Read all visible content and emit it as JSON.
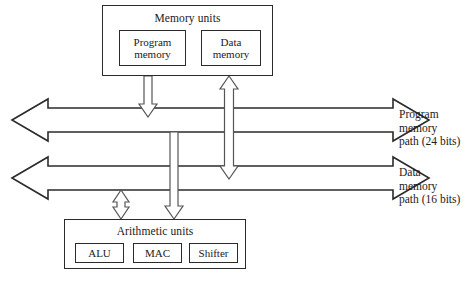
{
  "diagram": {
    "memory_units": {
      "title": "Memory units",
      "units": [
        {
          "id": "program-memory",
          "label": "Program\nmemory"
        },
        {
          "id": "data-memory",
          "label": "Data\nmemory"
        }
      ]
    },
    "arithmetic_units": {
      "title": "Arithmetic units",
      "units": [
        {
          "id": "alu",
          "label": "ALU"
        },
        {
          "id": "mac",
          "label": "MAC"
        },
        {
          "id": "shifter",
          "label": "Shifter"
        }
      ]
    },
    "buses": [
      {
        "id": "program-bus",
        "label": "Program\nmemory\npath (24 bits)",
        "width_bits": 24,
        "direction": "bidirectional"
      },
      {
        "id": "data-bus",
        "label": "Data\nmemory\npath (16 bits)",
        "width_bits": 16,
        "direction": "bidirectional"
      }
    ],
    "connectors": [
      {
        "id": "program-memory-to-program-bus",
        "direction": "down"
      },
      {
        "id": "data-memory-to-data-bus",
        "direction": "bidirectional"
      },
      {
        "id": "program-bus-to-arithmetic-units",
        "direction": "down"
      },
      {
        "id": "data-bus-to-arithmetic-units",
        "direction": "bidirectional"
      }
    ],
    "colors": {
      "stroke": "#2b2b2b",
      "background": "#ffffff"
    }
  }
}
